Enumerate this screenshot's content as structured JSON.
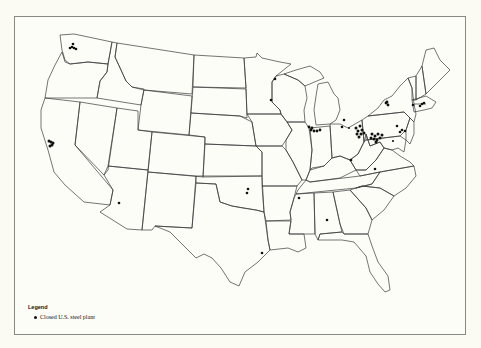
{
  "map": {
    "title": "",
    "region": "Contiguous United States",
    "background_color": "#fdfdf7",
    "border_color": "#3a3a3a",
    "marker_color": "#111111"
  },
  "legend": {
    "title": "Legend",
    "items": [
      {
        "label": "Closed U.S. steel plant",
        "symbol": "filled-circle"
      }
    ]
  },
  "markers": [
    {
      "region": "Seattle/Tacoma, WA",
      "x": 73,
      "y": 47,
      "cluster": true
    },
    {
      "region": "San Francisco Bay, CA",
      "x": 51,
      "y": 143,
      "cluster": true
    },
    {
      "region": "Arizona",
      "x": 119,
      "y": 203
    },
    {
      "region": "Duluth, MN",
      "x": 275,
      "y": 79
    },
    {
      "region": "Minnesota (Twin Cities)",
      "x": 271,
      "y": 100
    },
    {
      "region": "Oklahoma",
      "x": 248,
      "y": 189
    },
    {
      "region": "Oklahoma",
      "x": 247,
      "y": 193
    },
    {
      "region": "Memphis, TN",
      "x": 299,
      "y": 198
    },
    {
      "region": "Alabama (Birmingham)",
      "x": 327,
      "y": 220
    },
    {
      "region": "Houston, TX",
      "x": 262,
      "y": 253
    },
    {
      "region": "Chicago/Gary, IL-IN",
      "x": 314,
      "y": 130,
      "cluster": true
    },
    {
      "region": "Detroit, MI",
      "x": 344,
      "y": 120
    },
    {
      "region": "Toledo, OH",
      "x": 342,
      "y": 127
    },
    {
      "region": "Cleveland/Youngstown, OH",
      "x": 360,
      "y": 131,
      "cluster": true
    },
    {
      "region": "Pittsburgh, PA",
      "x": 377,
      "y": 137,
      "cluster": true
    },
    {
      "region": "Buffalo, NY",
      "x": 387,
      "y": 104,
      "cluster": true
    },
    {
      "region": "Kentucky",
      "x": 351,
      "y": 160
    },
    {
      "region": "Virginia",
      "x": 375,
      "y": 169
    },
    {
      "region": "Eastern PA",
      "x": 403,
      "y": 126,
      "cluster": true
    },
    {
      "region": "Bethlehem, PA",
      "x": 397,
      "y": 126
    },
    {
      "region": "Massachusetts",
      "x": 424,
      "y": 104
    },
    {
      "region": "Connecticut/MA",
      "x": 421,
      "y": 108,
      "cluster": true
    },
    {
      "region": "Maryland",
      "x": 398,
      "y": 135
    }
  ]
}
